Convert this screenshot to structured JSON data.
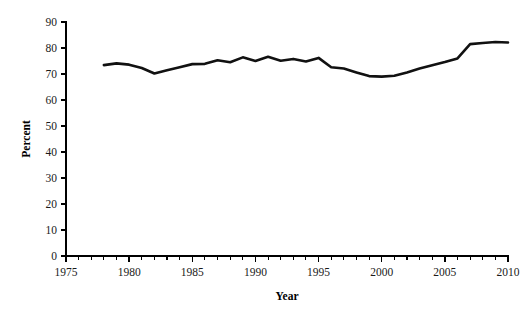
{
  "chart_data": {
    "type": "line",
    "title": "",
    "xlabel": "Year",
    "ylabel": "Percent",
    "xlim": [
      1975,
      2010
    ],
    "ylim": [
      0,
      90
    ],
    "grid": false,
    "legend": null,
    "x_major_ticks": [
      1975,
      1980,
      1985,
      1990,
      1995,
      2000,
      2005,
      2010
    ],
    "x_tick_labels": [
      "1975",
      "1980",
      "1985",
      "1990",
      "1995",
      "2000",
      "2005",
      "2010"
    ],
    "x_minor_tick_step": 1,
    "y_major_ticks": [
      0,
      10,
      20,
      30,
      40,
      50,
      60,
      70,
      80,
      90
    ],
    "y_tick_labels": [
      "0",
      "10",
      "20",
      "30",
      "40",
      "50",
      "60",
      "70",
      "80",
      "90"
    ],
    "series": [
      {
        "name": "Percent",
        "color": "#111111",
        "x": [
          1978,
          1979,
          1980,
          1981,
          1982,
          1983,
          1984,
          1985,
          1986,
          1987,
          1988,
          1989,
          1990,
          1991,
          1992,
          1993,
          1994,
          1995,
          1996,
          1997,
          1998,
          1999,
          2000,
          2001,
          2002,
          2003,
          2004,
          2005,
          2006,
          2007,
          2008,
          2009,
          2010
        ],
        "values": [
          73.4,
          74.1,
          73.6,
          72.3,
          70.2,
          71.4,
          72.6,
          73.8,
          73.9,
          75.3,
          74.5,
          76.4,
          75.0,
          76.6,
          75.1,
          75.8,
          74.8,
          76.2,
          72.6,
          72.1,
          70.6,
          69.2,
          69.0,
          69.3,
          70.6,
          72.1,
          73.4,
          74.6,
          76.0,
          77.0,
          79.6,
          79.8,
          81.4
        ],
        "values_tail": [
          81.5,
          81.9,
          82.3,
          82.1
        ]
      }
    ],
    "x_tail": [
      2007,
      2008,
      2009,
      2010
    ]
  },
  "axis": {
    "y_title": "Percent",
    "x_title": "Year"
  }
}
